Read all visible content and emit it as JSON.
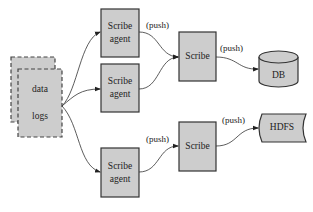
{
  "diagram": {
    "colors": {
      "fill": "#cdcdcd",
      "stroke": "#333333",
      "background": "#ffffff"
    },
    "source": {
      "line1": "data",
      "line2": "logs"
    },
    "agents": [
      {
        "line1": "Scribe",
        "line2": "agent"
      },
      {
        "line1": "Scribe",
        "line2": "agent"
      },
      {
        "line1": "Scribe",
        "line2": "agent"
      }
    ],
    "servers": [
      {
        "label": "Scribe"
      },
      {
        "label": "Scribe"
      }
    ],
    "sinks": {
      "db": "DB",
      "hdfs": "HDFS"
    },
    "edge_labels": {
      "agent1_to_scribe": "(push)",
      "scribe_to_db": "(push)",
      "agent3_to_scribe": "(push)",
      "scribe_to_hdfs": "(push)"
    }
  }
}
